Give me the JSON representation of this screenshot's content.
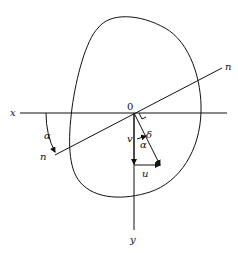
{
  "diagram": {
    "labels": {
      "x_axis": "x",
      "y_axis": "y",
      "origin": "0",
      "neutral_axis_left": "n",
      "neutral_axis_right": "n",
      "angle_left": "α",
      "angle_vector": "α",
      "deflection": "δ",
      "vertical_component": "v",
      "horizontal_component": "u"
    },
    "colors": {
      "line": "#111111",
      "background": "#ffffff"
    }
  }
}
